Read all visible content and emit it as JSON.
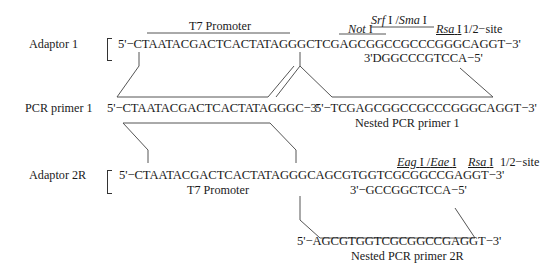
{
  "adaptor1": {
    "label": "Adaptor 1",
    "top_strand": "5'−CTAATACGACTCACTATAGGGCTCGAGCGGCCGCCCGGGCAGGT−3'",
    "bottom_strand": "3'DGGCCCGTCCA−5'",
    "t7_label": "T7 Promoter",
    "not1_label": "Not",
    "not1_roman": "I",
    "srf_label": "Srf",
    "srf_roman": "I /",
    "sma_label": "Sma",
    "sma_roman": "I",
    "rsa_label": "Rsa",
    "rsa_roman": "I",
    "half_site": "1/2−site"
  },
  "pcr_primer1": {
    "label": "PCR primer 1",
    "sequence": "5'−CTAATACGACTCACTATAGGGC−3'"
  },
  "nested_primer1": {
    "sequence": "5'−TCGAGCGGCCGCCCGGGCAGGT−3'",
    "label": "Nested PCR primer 1"
  },
  "adaptor2r": {
    "label": "Adaptor 2R",
    "top_strand": "5'−CTAATACGACTCACTATAGGGCAGCGTGGTCGCGGCCGAGGT−3'",
    "bottom_strand": "3'−GCCGGCTCCA−5'",
    "t7_label": "T7 Promoter",
    "eag_label": "Eag",
    "eag_roman": "I /",
    "eae_label": "Eae",
    "eae_roman": "I",
    "rsa_label": "Rsa",
    "rsa_roman": "I",
    "half_site": "1/2−site"
  },
  "nested_primer2r": {
    "sequence": "5'−AGCGTGGTCGCGGCCGAGGT−3'",
    "label": "Nested PCR primer 2R"
  }
}
